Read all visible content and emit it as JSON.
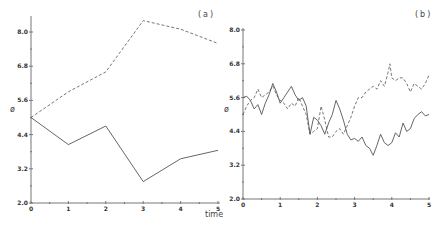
{
  "chart_data": [
    {
      "type": "line",
      "panel_label": "(a)",
      "title": "",
      "xlabel": "time",
      "ylabel": "ø",
      "xlim": [
        0,
        5
      ],
      "ylim": [
        2.0,
        8.6
      ],
      "x_ticks": [
        "0",
        "1",
        "2",
        "3",
        "4",
        "5"
      ],
      "y_ticks": [
        "2.0",
        "3.2",
        "4.4",
        "5.6",
        "6.8",
        "8.0"
      ],
      "grid": false,
      "legend": null,
      "series": [
        {
          "name": "solid",
          "style": "solid",
          "x": [
            0,
            1,
            2,
            3,
            4,
            5
          ],
          "values": [
            5.0,
            4.05,
            4.7,
            2.75,
            3.55,
            3.85
          ]
        },
        {
          "name": "dashed",
          "style": "dashed",
          "x": [
            0,
            1,
            2,
            3,
            4,
            5
          ],
          "values": [
            5.0,
            5.9,
            6.6,
            8.4,
            8.1,
            7.6
          ]
        }
      ]
    },
    {
      "type": "line",
      "panel_label": "(b)",
      "title": "",
      "xlabel": "time",
      "ylabel": "ø",
      "xlim": [
        0,
        5
      ],
      "ylim": [
        2.0,
        8.0
      ],
      "x_ticks": [
        "0",
        "1",
        "2",
        "3",
        "4",
        "5"
      ],
      "y_ticks": [
        "2.0",
        "3.2",
        "4.4",
        "5.6",
        "6.8",
        "8.0"
      ],
      "grid": false,
      "legend": null,
      "series": [
        {
          "name": "solid",
          "style": "solid",
          "x": [
            0,
            0.1,
            0.2,
            0.3,
            0.4,
            0.5,
            0.6,
            0.7,
            0.8,
            0.9,
            1.0,
            1.1,
            1.2,
            1.3,
            1.4,
            1.5,
            1.6,
            1.7,
            1.8,
            1.9,
            2.0,
            2.1,
            2.2,
            2.3,
            2.4,
            2.5,
            2.6,
            2.7,
            2.8,
            2.9,
            3.0,
            3.1,
            3.2,
            3.3,
            3.4,
            3.5,
            3.6,
            3.7,
            3.8,
            3.9,
            4.0,
            4.1,
            4.2,
            4.3,
            4.4,
            4.5,
            4.6,
            4.7,
            4.8,
            4.9,
            5.0
          ],
          "values": [
            5.6,
            5.65,
            5.5,
            5.2,
            5.35,
            5.0,
            5.4,
            5.7,
            6.1,
            5.8,
            5.4,
            5.6,
            5.8,
            6.0,
            5.7,
            5.5,
            5.6,
            5.3,
            4.3,
            4.9,
            4.8,
            4.6,
            4.3,
            4.7,
            5.0,
            5.5,
            5.2,
            4.8,
            4.3,
            4.1,
            4.15,
            4.05,
            4.2,
            3.9,
            3.8,
            3.55,
            3.9,
            4.3,
            4.0,
            3.9,
            4.0,
            4.35,
            4.2,
            4.7,
            4.4,
            4.5,
            4.85,
            5.0,
            5.1,
            4.95,
            5.0
          ]
        },
        {
          "name": "dashed",
          "style": "dashed",
          "x": [
            0,
            0.1,
            0.2,
            0.3,
            0.4,
            0.5,
            0.6,
            0.7,
            0.8,
            0.9,
            1.0,
            1.1,
            1.2,
            1.3,
            1.4,
            1.5,
            1.6,
            1.7,
            1.8,
            1.9,
            2.0,
            2.1,
            2.2,
            2.3,
            2.4,
            2.5,
            2.6,
            2.7,
            2.8,
            2.9,
            3.0,
            3.1,
            3.2,
            3.3,
            3.4,
            3.5,
            3.6,
            3.7,
            3.8,
            3.9,
            3.95,
            4.0,
            4.1,
            4.2,
            4.3,
            4.4,
            4.5,
            4.6,
            4.7,
            4.8,
            4.9,
            5.0
          ],
          "values": [
            5.0,
            5.3,
            5.5,
            5.6,
            5.9,
            5.6,
            5.7,
            5.8,
            6.0,
            5.7,
            5.5,
            5.4,
            5.2,
            5.4,
            5.3,
            5.6,
            5.3,
            5.0,
            4.3,
            4.4,
            4.5,
            5.3,
            4.8,
            4.2,
            4.2,
            4.4,
            4.5,
            4.3,
            4.6,
            4.9,
            5.3,
            5.6,
            5.6,
            5.8,
            5.9,
            6.0,
            5.9,
            6.2,
            6.0,
            6.5,
            6.8,
            6.3,
            6.2,
            6.3,
            6.3,
            6.1,
            5.8,
            6.1,
            6.0,
            5.9,
            6.1,
            6.4
          ]
        }
      ]
    }
  ]
}
